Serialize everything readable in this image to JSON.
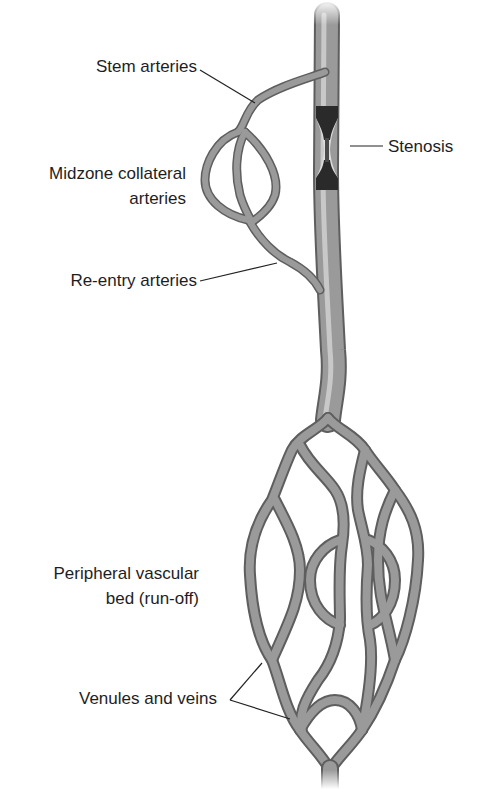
{
  "diagram": {
    "type": "anatomical-illustration",
    "labels": {
      "stem_arteries": "Stem arteries",
      "stenosis": "Stenosis",
      "midzone_line1": "Midzone collateral",
      "midzone_line2": "arteries",
      "reentry_arteries": "Re-entry arteries",
      "peripheral_line1": "Peripheral vascular",
      "peripheral_line2": "bed (run-off)",
      "venules_veins": "Venules and veins"
    },
    "colors": {
      "vessel_fill": "#9a9a9a",
      "vessel_edge": "#5e5e5e",
      "vessel_highlight": "#c8c8c8",
      "stenosis_dark": "#2a2a2a",
      "stenosis_light": "#dcdcdc",
      "leader_line": "#222222"
    }
  }
}
